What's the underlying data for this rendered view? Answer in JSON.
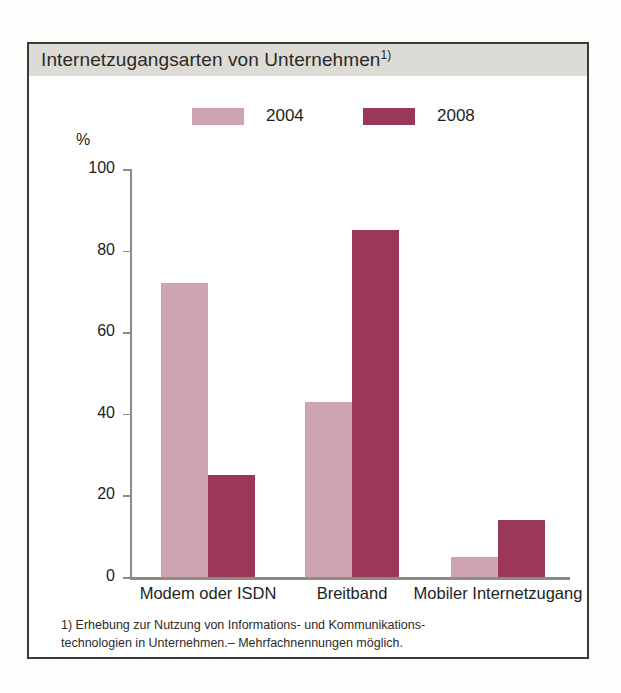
{
  "panel": {
    "title": "Internetzugangsarten von Unternehmen",
    "title_superscript": "1)"
  },
  "colors": {
    "series_2004": "#cfa3b0",
    "series_2008": "#9b3759",
    "title_band": "#dcdbd6",
    "frame": "#3c3a38",
    "axis": "#8d8b86",
    "text": "#201f1d"
  },
  "legend": {
    "items": [
      {
        "label": "2004",
        "color": "#cfa3b0"
      },
      {
        "label": "2008",
        "color": "#9b3759"
      }
    ]
  },
  "axis": {
    "y_unit": "%",
    "y_ticks": [
      "100",
      "80",
      "60",
      "40",
      "20",
      "0"
    ]
  },
  "footnote": {
    "line1": "1) Erhebung zur  Nutzung von Informations- und Kommunikations-",
    "line2": "technologien in Unternehmen.– Mehrfachnennungen möglich."
  },
  "chart_data": {
    "type": "bar",
    "xlabel": "",
    "ylabel": "%",
    "ylim": [
      0,
      100
    ],
    "yticks": [
      0,
      20,
      40,
      60,
      80,
      100
    ],
    "grid": false,
    "legend_position": "top",
    "categories": [
      "Modem oder ISDN",
      "Breitband",
      "Mobiler Internetzugang"
    ],
    "series": [
      {
        "name": "2004",
        "color": "#cfa3b0",
        "values": [
          72,
          43,
          5
        ]
      },
      {
        "name": "2008",
        "color": "#9b3759",
        "values": [
          25,
          85,
          14
        ]
      }
    ],
    "annotations": [
      "1) Erhebung zur Nutzung von Informations- und Kommunikationstechnologien in Unternehmen.– Mehrfachnennungen möglich."
    ]
  }
}
